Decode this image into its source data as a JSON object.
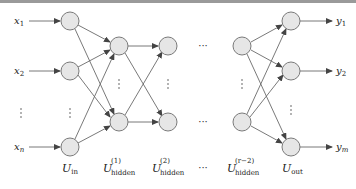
{
  "diagram": {
    "type": "feedforward-neural-network",
    "inputs": [
      "x",
      "x",
      "x"
    ],
    "input_subscripts": [
      "1",
      "2",
      "n"
    ],
    "outputs": [
      "y",
      "y",
      "y"
    ],
    "output_subscripts": [
      "1",
      "2",
      "m"
    ],
    "layers": [
      {
        "name": "U",
        "sub": "in",
        "sup": ""
      },
      {
        "name": "U",
        "sub": "hidden",
        "sup": "(1)"
      },
      {
        "name": "U",
        "sub": "hidden",
        "sup": "(2)"
      },
      {
        "name": "",
        "sub": "",
        "sup": ""
      },
      {
        "name": "U",
        "sub": "hidden",
        "sup": "(r−2)"
      },
      {
        "name": "U",
        "sub": "out",
        "sup": ""
      }
    ],
    "ellipsis_h": "···",
    "colors": {
      "node_fill": "#e6e6e6",
      "node_stroke": "#7a7a7a",
      "edge": "#6a6a6a",
      "text": "#222222"
    }
  }
}
